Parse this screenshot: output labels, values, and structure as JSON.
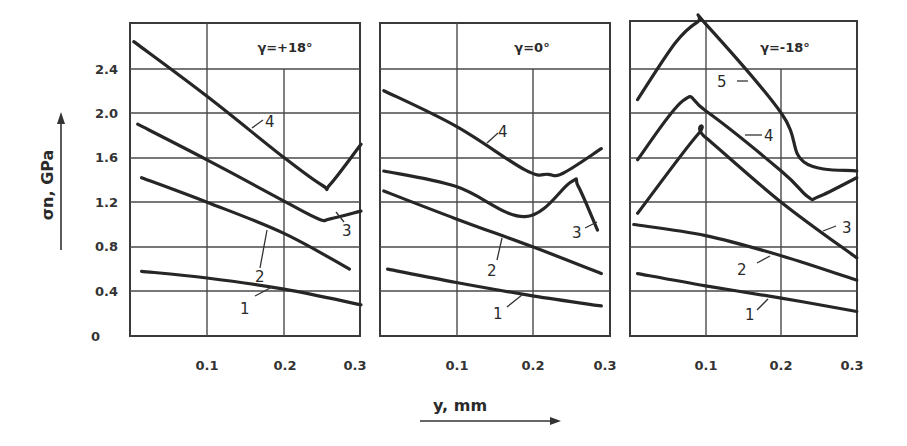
{
  "chart_data": [
    {
      "type": "line",
      "title": "γ=+18°",
      "xlabel": "y, mm",
      "ylabel": "σn, GPa",
      "xlim": [
        0,
        0.3
      ],
      "ylim": [
        0,
        2.8
      ],
      "xticks": [
        "0.1",
        "0.2",
        "0.3"
      ],
      "yticks": [
        "0",
        "0.4",
        "0.8",
        "1.2",
        "1.6",
        "2.0",
        "2.4"
      ],
      "grid": true,
      "series": [
        {
          "name": "1",
          "points": [
            [
              0.015,
              0.58
            ],
            [
              0.1,
              0.52
            ],
            [
              0.2,
              0.42
            ],
            [
              0.3,
              0.28
            ]
          ]
        },
        {
          "name": "2",
          "points": [
            [
              0.015,
              1.42
            ],
            [
              0.1,
              1.2
            ],
            [
              0.2,
              0.92
            ],
            [
              0.285,
              0.6
            ]
          ]
        },
        {
          "name": "3",
          "points": [
            [
              0.01,
              1.9
            ],
            [
              0.1,
              1.58
            ],
            [
              0.2,
              1.21
            ],
            [
              0.245,
              1.05
            ],
            [
              0.26,
              1.05
            ],
            [
              0.3,
              1.12
            ]
          ]
        },
        {
          "name": "4",
          "points": [
            [
              0.005,
              2.64
            ],
            [
              0.1,
              2.15
            ],
            [
              0.2,
              1.6
            ],
            [
              0.25,
              1.35
            ],
            [
              0.26,
              1.36
            ],
            [
              0.3,
              1.72
            ]
          ]
        }
      ]
    },
    {
      "type": "line",
      "title": "γ=0°",
      "xlabel": "y, mm",
      "ylabel": "σn, GPa",
      "xlim": [
        0,
        0.3
      ],
      "ylim": [
        0,
        2.8
      ],
      "xticks": [
        "0.1",
        "0.2",
        "0.3"
      ],
      "grid": true,
      "series": [
        {
          "name": "1",
          "points": [
            [
              0.01,
              0.6
            ],
            [
              0.1,
              0.48
            ],
            [
              0.2,
              0.36
            ],
            [
              0.29,
              0.27
            ]
          ]
        },
        {
          "name": "2",
          "points": [
            [
              0.005,
              1.3
            ],
            [
              0.1,
              1.05
            ],
            [
              0.2,
              0.8
            ],
            [
              0.29,
              0.56
            ]
          ]
        },
        {
          "name": "3",
          "points": [
            [
              0.005,
              1.48
            ],
            [
              0.1,
              1.34
            ],
            [
              0.19,
              1.07
            ],
            [
              0.25,
              1.38
            ],
            [
              0.26,
              1.34
            ],
            [
              0.285,
              0.95
            ]
          ]
        },
        {
          "name": "4",
          "points": [
            [
              0.005,
              2.2
            ],
            [
              0.1,
              1.88
            ],
            [
              0.19,
              1.49
            ],
            [
              0.22,
              1.45
            ],
            [
              0.24,
              1.46
            ],
            [
              0.29,
              1.68
            ]
          ]
        }
      ]
    },
    {
      "type": "line",
      "title": "γ=-18°",
      "xlabel": "y, mm",
      "ylabel": "σn, GPa",
      "xlim": [
        0,
        0.3
      ],
      "ylim": [
        0,
        2.8
      ],
      "xticks": [
        "0.1",
        "0.2",
        "0.3"
      ],
      "grid": true,
      "series": [
        {
          "name": "1",
          "points": [
            [
              0.01,
              0.56
            ],
            [
              0.1,
              0.45
            ],
            [
              0.2,
              0.34
            ],
            [
              0.3,
              0.22
            ]
          ]
        },
        {
          "name": "2",
          "points": [
            [
              0.005,
              1.0
            ],
            [
              0.1,
              0.9
            ],
            [
              0.2,
              0.72
            ],
            [
              0.3,
              0.5
            ]
          ]
        },
        {
          "name": "3",
          "points": [
            [
              0.01,
              1.1
            ],
            [
              0.09,
              1.81
            ],
            [
              0.1,
              1.78
            ],
            [
              0.2,
              1.2
            ],
            [
              0.3,
              0.7
            ]
          ]
        },
        {
          "name": "4",
          "points": [
            [
              0.01,
              1.58
            ],
            [
              0.07,
              2.11
            ],
            [
              0.1,
              2.02
            ],
            [
              0.2,
              1.48
            ],
            [
              0.235,
              1.25
            ],
            [
              0.25,
              1.25
            ],
            [
              0.3,
              1.42
            ]
          ]
        },
        {
          "name": "5",
          "points": [
            [
              0.01,
              2.12
            ],
            [
              0.06,
              2.63
            ],
            [
              0.09,
              2.82
            ],
            [
              0.1,
              2.8
            ],
            [
              0.2,
              2.0
            ],
            [
              0.23,
              1.56
            ],
            [
              0.3,
              1.48
            ]
          ]
        }
      ]
    }
  ],
  "axes": {
    "ylabel": "σn, GPa",
    "xlabel": "y, mm",
    "yticks": [
      "2.4",
      "2.0",
      "1.6",
      "1.2",
      "0.8",
      "0.4",
      "0"
    ],
    "xticks": [
      "0.1",
      "0.2",
      "0.3"
    ]
  },
  "panels": [
    {
      "title": "γ=+18°",
      "labels": [
        "1",
        "2",
        "3",
        "4"
      ]
    },
    {
      "title": "γ=0°",
      "labels": [
        "1",
        "2",
        "3",
        "4"
      ]
    },
    {
      "title": "γ=-18°",
      "labels": [
        "1",
        "2",
        "3",
        "4",
        "5"
      ]
    }
  ]
}
